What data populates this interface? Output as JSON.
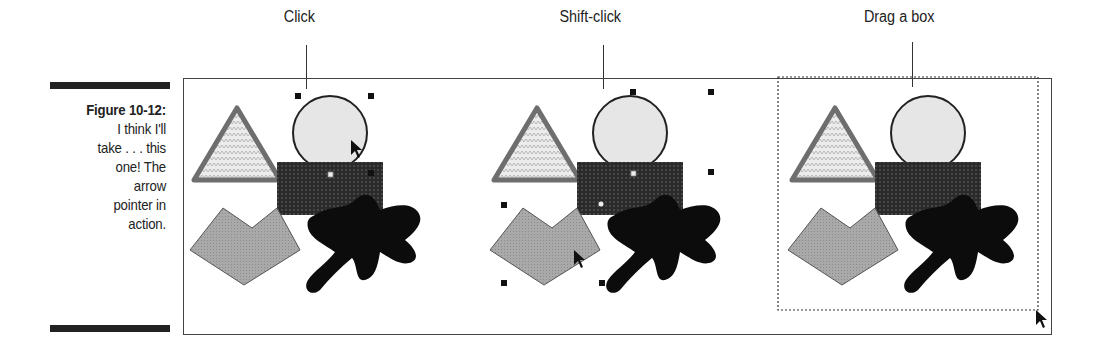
{
  "figure": {
    "number_label": "Figure 10-12:",
    "caption_lines": [
      "I think I'll",
      "take . . . this",
      "one! The",
      "arrow",
      "pointer in",
      "action."
    ]
  },
  "panels": [
    {
      "label": "Click",
      "selection": "circle"
    },
    {
      "label": "Shift-click",
      "selection": "circle+pentagon"
    },
    {
      "label": "Drag a box",
      "selection": "marquee"
    }
  ],
  "colors": {
    "triangle_stroke": "#6e6e6e",
    "triangle_fill": "#e2e2e2",
    "circle_fill": "#e6e6e6",
    "rect_fill": "#2a2a2a",
    "pentagon_fill": "#a9a9a9",
    "blob_fill": "#0c0c0c",
    "handle": "#111111"
  }
}
